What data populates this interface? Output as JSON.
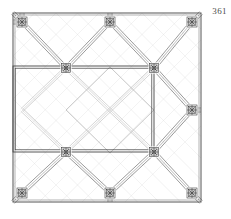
{
  "plate": {
    "number_label": "361",
    "caption": "",
    "title": "Vault rib plan — square bay with diagonal rib lattice"
  },
  "colors": {
    "background": "#ffffff",
    "frame_stroke": "#555555",
    "rib_strong": "#3a3a3a",
    "rib_medium": "#6e6e6e",
    "rib_faint": "#b4b4b4",
    "rib_ghost": "#cfcfcf",
    "rosette_stroke": "#2e2e2e",
    "number_text": "#4a4a4a"
  },
  "frame": {
    "x": 13,
    "y": 13,
    "width": 188,
    "height": 189,
    "stroke_width": 1
  },
  "grid": {
    "columns_x": [
      22,
      66,
      110,
      154,
      192
    ],
    "rows_y": [
      22,
      68,
      110,
      152,
      193
    ],
    "node_pitch_x": 44,
    "node_pitch_y": 43
  },
  "rosettes": [
    {
      "name": "rosette-top-left",
      "cx": 22,
      "cy": 22,
      "r": 5.0,
      "spokes": 8,
      "rings": 3
    },
    {
      "name": "rosette-top-center",
      "cx": 110,
      "cy": 22,
      "r": 5.0,
      "spokes": 8,
      "rings": 3
    },
    {
      "name": "rosette-top-right",
      "cx": 192,
      "cy": 22,
      "r": 5.0,
      "spokes": 8,
      "rings": 3
    },
    {
      "name": "rosette-mid-right",
      "cx": 192,
      "cy": 110,
      "r": 5.0,
      "spokes": 8,
      "rings": 3
    },
    {
      "name": "rosette-bottom-left",
      "cx": 22,
      "cy": 193,
      "r": 5.0,
      "spokes": 8,
      "rings": 3
    },
    {
      "name": "rosette-bottom-center",
      "cx": 110,
      "cy": 193,
      "r": 5.0,
      "spokes": 8,
      "rings": 3
    },
    {
      "name": "rosette-bottom-right",
      "cx": 192,
      "cy": 193,
      "r": 5.0,
      "spokes": 8,
      "rings": 3
    },
    {
      "name": "rosette-inner-upper-left",
      "cx": 66,
      "cy": 68,
      "r": 4.4,
      "spokes": 8,
      "rings": 3
    },
    {
      "name": "rosette-inner-upper-right",
      "cx": 154,
      "cy": 68,
      "r": 4.4,
      "spokes": 8,
      "rings": 3
    },
    {
      "name": "rosette-inner-lower-left",
      "cx": 66,
      "cy": 152,
      "r": 4.4,
      "spokes": 8,
      "rings": 3
    },
    {
      "name": "rosette-inner-lower-right",
      "cx": 154,
      "cy": 152,
      "r": 4.4,
      "spokes": 8,
      "rings": 3
    }
  ],
  "highlight_panel": {
    "name": "emphasised-bay-rectangle",
    "x": 13,
    "y": 66,
    "width": 141,
    "height": 86,
    "stroke": "#3a3a3a",
    "double_offset": 2.2,
    "note": "double-ruled rectangle spanning left frame to the inner-right rosette column"
  },
  "diamond": {
    "name": "central-rotated-square",
    "cx": 110,
    "cy": 110,
    "half_diagonal_x": 44,
    "half_diagonal_y": 43,
    "stroke": "#b4b4b4"
  },
  "ribs": {
    "band_offset": 2.0,
    "description": "Each diagonal rib drawn as a pair of parallel lines flanking a centre line; ribs run at 45 degrees between adjacent grid nodes.",
    "strong_segments": [
      {
        "x1": 22,
        "y1": 22,
        "x2": 66,
        "y2": 68
      },
      {
        "x1": 110,
        "y1": 22,
        "x2": 66,
        "y2": 68
      },
      {
        "x1": 110,
        "y1": 22,
        "x2": 154,
        "y2": 68
      },
      {
        "x1": 192,
        "y1": 22,
        "x2": 154,
        "y2": 68
      },
      {
        "x1": 192,
        "y1": 110,
        "x2": 154,
        "y2": 68
      },
      {
        "x1": 192,
        "y1": 110,
        "x2": 154,
        "y2": 152
      },
      {
        "x1": 192,
        "y1": 193,
        "x2": 154,
        "y2": 152
      },
      {
        "x1": 110,
        "y1": 193,
        "x2": 154,
        "y2": 152
      },
      {
        "x1": 110,
        "y1": 193,
        "x2": 66,
        "y2": 152
      },
      {
        "x1": 22,
        "y1": 193,
        "x2": 66,
        "y2": 152
      }
    ],
    "faint_segments": [
      {
        "x1": 22,
        "y1": 110,
        "x2": 66,
        "y2": 68
      },
      {
        "x1": 22,
        "y1": 110,
        "x2": 66,
        "y2": 152
      },
      {
        "x1": 66,
        "y1": 68,
        "x2": 110,
        "y2": 110
      },
      {
        "x1": 110,
        "y1": 110,
        "x2": 154,
        "y2": 68
      },
      {
        "x1": 66,
        "y1": 152,
        "x2": 110,
        "y2": 110
      },
      {
        "x1": 110,
        "y1": 110,
        "x2": 154,
        "y2": 152
      }
    ],
    "corner_tails": [
      {
        "x1": 13,
        "y1": 13,
        "x2": 22,
        "y2": 22
      },
      {
        "x1": 201,
        "y1": 13,
        "x2": 192,
        "y2": 22
      },
      {
        "x1": 13,
        "y1": 202,
        "x2": 22,
        "y2": 193
      },
      {
        "x1": 201,
        "y1": 202,
        "x2": 192,
        "y2": 193
      },
      {
        "x1": 110,
        "y1": 13,
        "x2": 110,
        "y2": 22
      },
      {
        "x1": 110,
        "y1": 193,
        "x2": 110,
        "y2": 202
      },
      {
        "x1": 192,
        "y1": 110,
        "x2": 201,
        "y2": 110
      },
      {
        "x1": 22,
        "y1": 22,
        "x2": 13,
        "y2": 22
      },
      {
        "x1": 22,
        "y1": 22,
        "x2": 22,
        "y2": 13
      }
    ]
  }
}
